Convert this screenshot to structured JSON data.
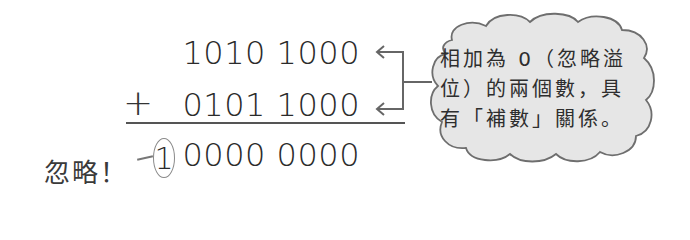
{
  "addition": {
    "operand1": "1010 1000",
    "operator": "+",
    "operand2": "0101 1000",
    "carry_digit": "1",
    "result_rest": "0000 0000"
  },
  "annotation": {
    "ignore_label": "忽略！"
  },
  "callout": {
    "lines": [
      "相加為 0（忽略溢",
      "位）的兩個數，具",
      "有「補數」關係。"
    ]
  },
  "colors": {
    "bubble_fill": "#e6e6e6",
    "bubble_stroke": "#6e6e6e",
    "arrow": "#666666",
    "text": "#2e2e2e"
  }
}
